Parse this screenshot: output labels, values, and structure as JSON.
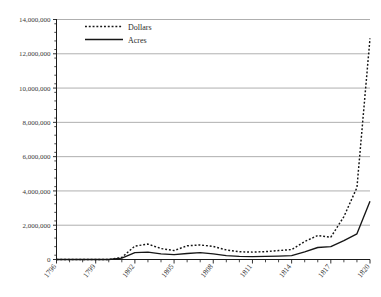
{
  "chart_data": {
    "type": "line",
    "title": "",
    "subtitle": "",
    "xlabel": "",
    "ylabel": "",
    "xlim": [
      1796,
      1820
    ],
    "ylim": [
      0,
      14000000
    ],
    "grid": true,
    "legend_position": "top-left",
    "x": [
      1796,
      1797,
      1798,
      1799,
      1800,
      1801,
      1802,
      1803,
      1804,
      1805,
      1806,
      1807,
      1808,
      1809,
      1810,
      1811,
      1812,
      1813,
      1814,
      1815,
      1816,
      1817,
      1818,
      1819,
      1820
    ],
    "xtick_labels": [
      "1796",
      "1799",
      "1802",
      "1805",
      "1808",
      "1811",
      "1814",
      "1817",
      "1820"
    ],
    "xtick_values": [
      1796,
      1799,
      1802,
      1805,
      1808,
      1811,
      1814,
      1817,
      1820
    ],
    "ytick_labels": [
      "0",
      "2,000,000",
      "4,000,000",
      "6,000,000",
      "8,000,000",
      "10,000,000",
      "12,000,000",
      "14,000,000"
    ],
    "ytick_values": [
      0,
      2000000,
      4000000,
      6000000,
      8000000,
      10000000,
      12000000,
      14000000
    ],
    "series": [
      {
        "name": "Dollars",
        "style": "dotted",
        "values": [
          0,
          0,
          0,
          0,
          0,
          120000,
          780000,
          900000,
          640000,
          520000,
          800000,
          850000,
          760000,
          560000,
          450000,
          430000,
          460000,
          520000,
          580000,
          1050000,
          1400000,
          1300000,
          2500000,
          4200000,
          12900000
        ]
      },
      {
        "name": "Acres",
        "style": "solid",
        "values": [
          0,
          0,
          0,
          0,
          0,
          80000,
          400000,
          430000,
          330000,
          280000,
          350000,
          400000,
          330000,
          230000,
          180000,
          170000,
          180000,
          200000,
          230000,
          450000,
          700000,
          750000,
          1100000,
          1500000,
          3400000
        ]
      }
    ],
    "peak_annotations": [
      {
        "series": "Dollars",
        "year": 1818,
        "value": 12900000
      },
      {
        "series": "Acres",
        "year": 1818,
        "value": 3400000
      }
    ],
    "end_values": [
      {
        "series": "Dollars",
        "year": 1820,
        "value": 1800000
      },
      {
        "series": "Acres",
        "year": 1820,
        "value": 100000
      }
    ]
  },
  "legend": {
    "entries": [
      {
        "label": "Dollars",
        "marker": "dotted-line-swatch"
      },
      {
        "label": "Acres",
        "marker": "solid-line-swatch"
      }
    ]
  },
  "colors": {
    "line": "#161616",
    "grid": "#9a9a9a",
    "axis": "#1a1a1a",
    "text": "#3a3a3a",
    "background": "#ffffff"
  }
}
